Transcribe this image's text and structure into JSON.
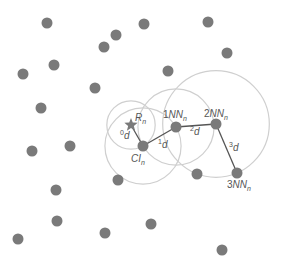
{
  "diagram": {
    "colors": {
      "dot": "#7a7a7a",
      "circle": "#cfcfcf",
      "edge": "#555555",
      "label": "#555555",
      "background": "#ffffff"
    },
    "background_nodes": [
      [
        47,
        23
      ],
      [
        144,
        24
      ],
      [
        208,
        22
      ],
      [
        116,
        35
      ],
      [
        104,
        47
      ],
      [
        227,
        53
      ],
      [
        54,
        65
      ],
      [
        23,
        74
      ],
      [
        168,
        71
      ],
      [
        95,
        88
      ],
      [
        41,
        108
      ],
      [
        32,
        151
      ],
      [
        70,
        146
      ],
      [
        118,
        180
      ],
      [
        56,
        190
      ],
      [
        197,
        174
      ],
      [
        57,
        221
      ],
      [
        105,
        233
      ],
      [
        151,
        224
      ],
      [
        18,
        239
      ],
      [
        222,
        250
      ]
    ],
    "key_nodes": [
      {
        "id": "R",
        "shape": "star",
        "x": 131,
        "y": 125,
        "label": "R",
        "sub": "n"
      },
      {
        "id": "CI",
        "shape": "dot",
        "x": 143,
        "y": 146,
        "label": "CI",
        "sub": "n"
      },
      {
        "id": "1NN",
        "shape": "dot",
        "x": 176,
        "y": 127,
        "label": "1NN",
        "sub": "n"
      },
      {
        "id": "2NN",
        "shape": "dot",
        "x": 216,
        "y": 124,
        "label": "2NN",
        "sub": "n"
      },
      {
        "id": "3NN",
        "shape": "dot",
        "x": 237,
        "y": 173,
        "label": "3NN",
        "sub": "n"
      }
    ],
    "edges": [
      {
        "from": "R",
        "to": "CI",
        "label": "d",
        "sup": "0"
      },
      {
        "from": "CI",
        "to": "1NN",
        "label": "d",
        "sup": "1"
      },
      {
        "from": "1NN",
        "to": "2NN",
        "label": "d",
        "sup": "2"
      },
      {
        "from": "2NN",
        "to": "3NN",
        "label": "d",
        "sup": "3"
      }
    ],
    "range_circles": [
      {
        "center": "R",
        "through": "CI"
      },
      {
        "center": "CI",
        "through": "1NN"
      },
      {
        "center": "1NN",
        "through": "CI"
      },
      {
        "center": "2NN",
        "through": "3NN"
      }
    ]
  }
}
